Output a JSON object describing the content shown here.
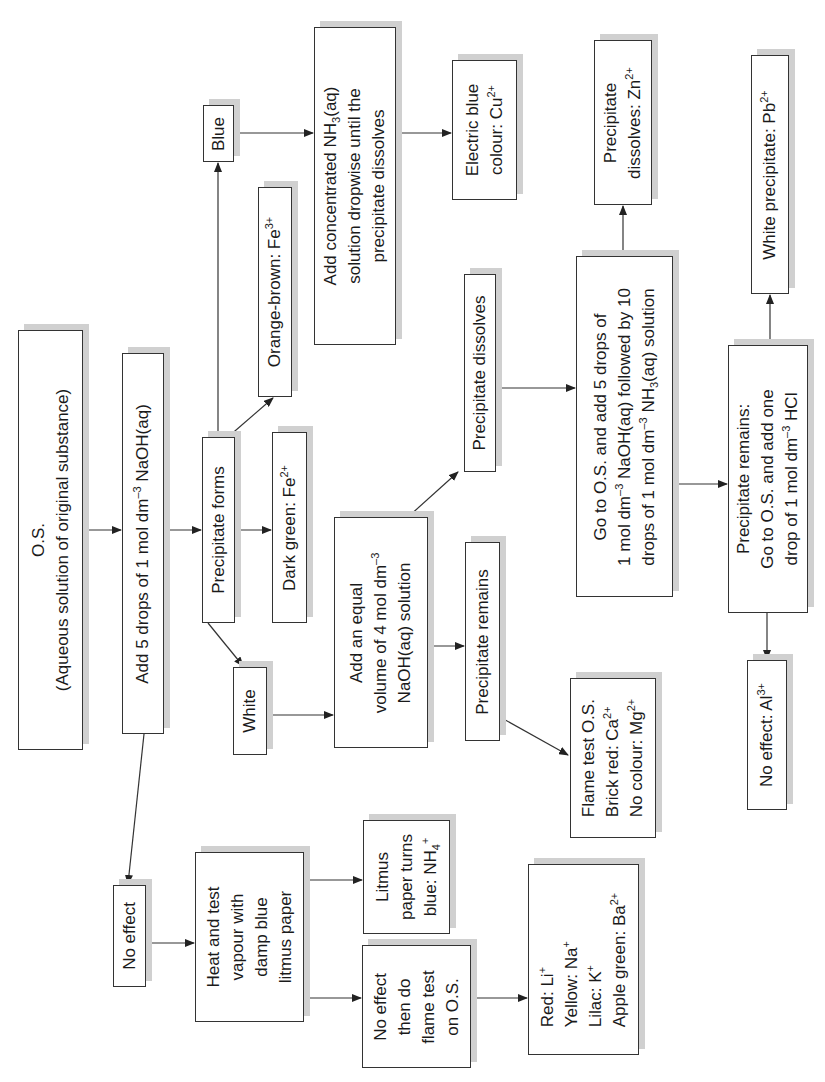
{
  "diagram": {
    "orientation": "rotated 90 degrees counter-clockwise",
    "accent_colors": {
      "line": "#333333",
      "shadow": "#d0d0d0",
      "background": "#ffffff"
    },
    "nodes": {
      "os": {
        "lines": [
          "O.S.",
          "(Aqueous solution of original substance)"
        ]
      },
      "add_naoh": {
        "lines": [
          "Add 5 drops of 1 mol dm–3 NaOH(aq)"
        ]
      },
      "precipitate_forms": {
        "lines": [
          "Precipitate forms"
        ]
      },
      "no_effect_left": {
        "lines": [
          "No effect"
        ]
      },
      "blue": {
        "lines": [
          "Blue"
        ]
      },
      "orange_brown": {
        "lines": [
          "Orange-brown: Fe3+"
        ]
      },
      "dark_green": {
        "lines": [
          "Dark green: Fe2+"
        ]
      },
      "white": {
        "lines": [
          "White"
        ]
      },
      "add_nh3_conc": {
        "lines": [
          "Add concentrated NH3(aq)",
          "solution dropwise until the",
          "precipitate dissolves"
        ]
      },
      "electric_blue": {
        "lines": [
          "Electric blue",
          "colour: Cu2+"
        ]
      },
      "add_equal_volume": {
        "lines": [
          "Add an equal",
          "volume of 4 mol dm–3",
          "NaOH(aq) solution"
        ]
      },
      "precipitate_dissolves": {
        "lines": [
          "Precipitate dissolves"
        ]
      },
      "precipitate_remains": {
        "lines": [
          "Precipitate remains"
        ]
      },
      "flame_test_ca_mg": {
        "lines": [
          "Flame test O.S.",
          "Brick red: Ca2+",
          "No colour: Mg2+"
        ]
      },
      "go_to_os_nh3": {
        "lines": [
          "Go to O.S. and add 5 drops of",
          "1 mol dm–3 NaOH(aq) followed by 10",
          "drops of 1 mol dm–3 NH3(aq) solution"
        ]
      },
      "dissolves_zn": {
        "lines": [
          "Precipitate",
          "dissolves: Zn2+"
        ]
      },
      "remains_hcl": {
        "lines": [
          "Precipitate remains:",
          "Go to O.S. and add one",
          "drop of 1 mol dm–3 HCl"
        ]
      },
      "white_pb": {
        "lines": [
          "White precipitate: Pb2+"
        ]
      },
      "no_effect_al": {
        "lines": [
          "No effect: Al3+"
        ]
      },
      "heat_test": {
        "lines": [
          "Heat and test",
          "vapour with",
          "damp blue",
          "litmus paper"
        ]
      },
      "litmus_nh4": {
        "lines": [
          "Litmus",
          "paper turns",
          "blue: NH4+"
        ]
      },
      "no_effect_flame": {
        "lines": [
          "No effect",
          "then do",
          "flame test",
          "on O.S."
        ]
      },
      "flame_group1": {
        "lines": [
          "Red: Li+",
          "Yellow: Na+",
          "Lilac: K+",
          "Apple green: Ba2+"
        ]
      }
    },
    "edges": [
      [
        "os",
        "add_naoh"
      ],
      [
        "add_naoh",
        "precipitate_forms"
      ],
      [
        "add_naoh",
        "no_effect_left"
      ],
      [
        "precipitate_forms",
        "blue"
      ],
      [
        "precipitate_forms",
        "orange_brown"
      ],
      [
        "precipitate_forms",
        "dark_green"
      ],
      [
        "precipitate_forms",
        "white"
      ],
      [
        "blue",
        "add_nh3_conc"
      ],
      [
        "add_nh3_conc",
        "electric_blue"
      ],
      [
        "white",
        "add_equal_volume"
      ],
      [
        "add_equal_volume",
        "precipitate_dissolves"
      ],
      [
        "add_equal_volume",
        "precipitate_remains"
      ],
      [
        "precipitate_remains",
        "flame_test_ca_mg"
      ],
      [
        "precipitate_dissolves",
        "go_to_os_nh3"
      ],
      [
        "go_to_os_nh3",
        "dissolves_zn"
      ],
      [
        "go_to_os_nh3",
        "remains_hcl"
      ],
      [
        "remains_hcl",
        "white_pb"
      ],
      [
        "remains_hcl",
        "no_effect_al"
      ],
      [
        "no_effect_left",
        "heat_test"
      ],
      [
        "heat_test",
        "litmus_nh4"
      ],
      [
        "heat_test",
        "no_effect_flame"
      ],
      [
        "no_effect_flame",
        "flame_group1"
      ]
    ]
  }
}
